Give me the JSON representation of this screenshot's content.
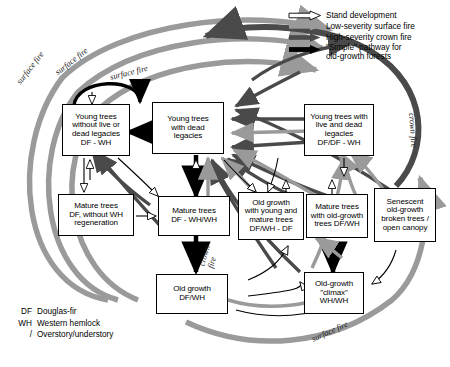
{
  "figure": {
    "type": "flow-diagram"
  },
  "legend": {
    "items": [
      {
        "id": "stand-development",
        "label": "Stand development",
        "style": "hollow-arrow",
        "color": "#ffffff"
      },
      {
        "id": "low-severity-surface-fire",
        "label": "Low-severity surface fire",
        "style": "solid-arrow",
        "color": "#9a9a9a"
      },
      {
        "id": "high-severity-crown-fire",
        "label": "High-severity crown fire",
        "style": "solid-arrow",
        "color": "#4a4a4a"
      },
      {
        "id": "simple-pathway",
        "label": "\"Simple\" pathway for\nold-growth forests",
        "style": "solid-arrow",
        "color": "#000000"
      }
    ]
  },
  "abbreviations": [
    {
      "key": "DF",
      "meaning": "Douglas-fir"
    },
    {
      "key": "WH",
      "meaning": "Western hemlock"
    },
    {
      "key": "/",
      "meaning": "Overstory/understory"
    }
  ],
  "nodes": [
    {
      "id": "young-no-legacies",
      "label": "Young trees\nwithout live or\ndead legacies\nDF - WH"
    },
    {
      "id": "young-dead-legacies",
      "label": "Young trees\nwith dead\nlegacies"
    },
    {
      "id": "young-live-dead-legacies",
      "label": "Young trees with\nlive and dead\nlegacies\nDF/DF - WH"
    },
    {
      "id": "mature-no-wh-regen",
      "label": "Mature trees\nDF, without WH\nregeneration"
    },
    {
      "id": "mature-df-wh",
      "label": "Mature trees\nDF - WH/WH"
    },
    {
      "id": "old-growth-young-mature",
      "label": "Old growth\nwith young and\nmature trees\nDF/WH - DF"
    },
    {
      "id": "mature-with-old-growth",
      "label": "Mature trees\nwith old-growth\ntrees DF/WH"
    },
    {
      "id": "senescent-old-growth",
      "label": "Senescent\nold-growth\nbroken trees /\nopen canopy"
    },
    {
      "id": "old-growth",
      "label": "Old growth\nDF/WH"
    },
    {
      "id": "old-growth-climax",
      "label": "Old-growth\n\"climax\"\nWH/WH"
    }
  ],
  "arc_labels": [
    {
      "id": "surface-fire-outer-left",
      "text": "surface fire"
    },
    {
      "id": "surface-fire-upper-left",
      "text": "surface fire"
    },
    {
      "id": "surface-fire-top-center",
      "text": "surface fire"
    },
    {
      "id": "crown-fire-right",
      "text": "crown fire"
    },
    {
      "id": "crown-fire-center",
      "text": "crown\nfire"
    },
    {
      "id": "surface-fire-bottom-right",
      "text": "surface fire"
    }
  ],
  "colors": {
    "surface_fire": "#9a9a9a",
    "crown_fire": "#4a4a4a",
    "simple_pathway": "#000000",
    "stand_development": "#ffffff",
    "outline": "#000000"
  }
}
